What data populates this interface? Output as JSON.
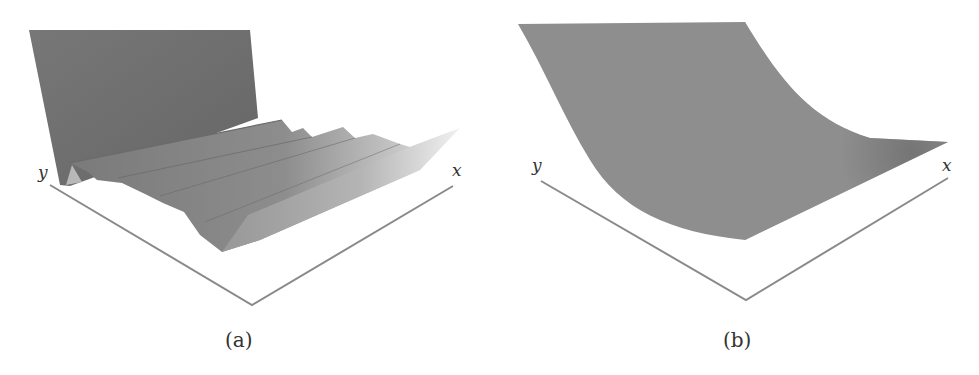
{
  "figure": {
    "panels": [
      {
        "id": "a",
        "caption": "(a)",
        "axes": {
          "x_label": "x",
          "y_label": "y"
        },
        "surface": {
          "description": "3D surface with a tall vertical wall at the back-left and a series of parallel sinusoidal ridges running along the x direction, fading lighter toward the +x edge",
          "ridge_count": 4,
          "fill_dark": "#6e6e6e",
          "fill_light": "#e6e6e6"
        },
        "axis_color": "#8a8a8a"
      },
      {
        "id": "b",
        "caption": "(b)",
        "axes": {
          "x_label": "x",
          "y_label": "y"
        },
        "surface": {
          "description": "smooth convex curved (bowl / parabolic-like) 3D surface, lowest at the front corner and rising toward the back-left and right",
          "fill": "#8e8e8e",
          "shadow": "#6a6a6a"
        },
        "axis_color": "#8a8a8a"
      }
    ]
  }
}
